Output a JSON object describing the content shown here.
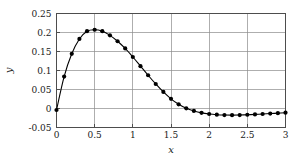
{
  "chart_data": {
    "type": "line",
    "title": "",
    "subtitle": "",
    "xlabel": "x",
    "ylabel": "y",
    "xlim": [
      0,
      3
    ],
    "ylim": [
      -0.05,
      0.25
    ],
    "xticks": [
      0,
      0.5,
      1,
      1.5,
      2,
      2.5,
      3
    ],
    "xticklabels": [
      "0",
      "0.5",
      "1",
      "1.5",
      "2",
      "2.5",
      "3"
    ],
    "yticks": [
      -0.05,
      0,
      0.05,
      0.1,
      0.15,
      0.2,
      0.25
    ],
    "yticklabels": [
      "-0.05",
      "0",
      "0.05",
      "0.1",
      "0.15",
      "0.2",
      "0.25"
    ],
    "grid": true,
    "legend": null,
    "marker": "circle-filled",
    "line_color": "#000000",
    "marker_color": "#000000",
    "grid_color": "#8c8c8c",
    "frame_color": "#4d4d4d",
    "background": "#ffffff",
    "x": [
      0.0,
      0.1,
      0.2,
      0.3,
      0.4,
      0.5,
      0.6,
      0.7,
      0.8,
      0.9,
      1.0,
      1.1,
      1.2,
      1.3,
      1.4,
      1.5,
      1.6,
      1.7,
      1.8,
      1.9,
      2.0,
      2.1,
      2.2,
      2.3,
      2.4,
      2.5,
      2.6,
      2.7,
      2.8,
      2.9,
      3.0
    ],
    "values": [
      -0.004,
      0.084,
      0.144,
      0.183,
      0.2035,
      0.2073,
      0.2035,
      0.1925,
      0.177,
      0.158,
      0.1355,
      0.1115,
      0.0875,
      0.0645,
      0.0435,
      0.0255,
      0.011,
      0.0005,
      -0.0065,
      -0.0115,
      -0.0145,
      -0.0163,
      -0.0172,
      -0.0175,
      -0.0172,
      -0.0165,
      -0.0155,
      -0.0145,
      -0.0133,
      -0.0122,
      -0.011
    ]
  }
}
